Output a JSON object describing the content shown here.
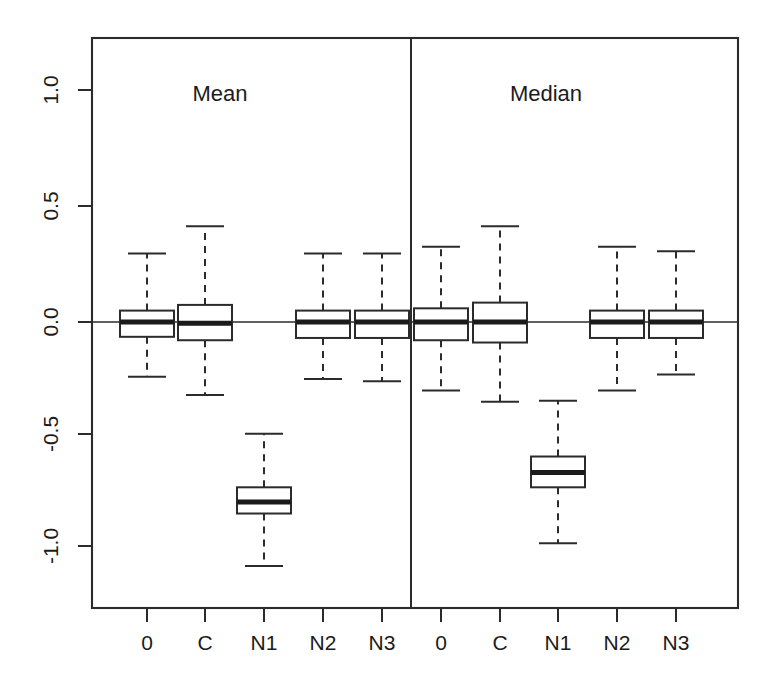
{
  "figure": {
    "title": "",
    "background_color": "#ffffff",
    "foreground_color": "#2b2b2b",
    "width": 769,
    "height": 695
  },
  "panels": [
    {
      "id": "mean",
      "label": "Mean",
      "label_x": 220,
      "label_y": 101
    },
    {
      "id": "median",
      "label": "Median",
      "label_x": 546,
      "label_y": 101
    }
  ],
  "axes": {
    "y": {
      "label": "",
      "ticks": [
        {
          "value": 1.0,
          "label": "1.0",
          "y": 90
        },
        {
          "value": 0.5,
          "label": "0.5",
          "y": 206
        },
        {
          "value": 0.0,
          "label": "0.0",
          "y": 322
        },
        {
          "value": -0.5,
          "label": "-0.5",
          "y": 434
        },
        {
          "value": -1.0,
          "label": "-1.0",
          "y": 546
        }
      ],
      "range": [
        -1.28,
        1.28
      ],
      "rotated_labels": true
    },
    "x": {
      "label": "",
      "ticks": [
        {
          "label": "0",
          "x": 147
        },
        {
          "label": "C",
          "x": 205
        },
        {
          "label": "N1",
          "x": 264
        },
        {
          "label": "N2",
          "x": 323
        },
        {
          "label": "N3",
          "x": 382
        },
        {
          "label": "0",
          "x": 441
        },
        {
          "label": "C",
          "x": 500
        },
        {
          "label": "N1",
          "x": 558
        },
        {
          "label": "N2",
          "x": 617
        },
        {
          "label": "N3",
          "x": 676
        }
      ]
    }
  },
  "geometry": {
    "plot_left": 92,
    "plot_right": 738,
    "plot_top": 38,
    "plot_bottom": 608,
    "divider_x": 411,
    "zero_y": 322,
    "px_per_unit": 228,
    "box_half_width": 27,
    "cap_half_width": 19
  },
  "chart_data": {
    "type": "boxplot",
    "title": "",
    "xlabel": "",
    "ylabel": "",
    "ylim": [
      -1.28,
      1.28
    ],
    "grid": false,
    "legend": "none",
    "reference_line": 0.0,
    "panels": [
      "Mean",
      "Median"
    ],
    "categories": [
      "0",
      "C",
      "N1",
      "N2",
      "N3"
    ],
    "boxes": [
      {
        "panel": "Mean",
        "category": "0",
        "whisker_low": -0.24,
        "q1": -0.065,
        "median": 0.0,
        "q3": 0.05,
        "whisker_high": 0.3
      },
      {
        "panel": "Mean",
        "category": "C",
        "whisker_low": -0.32,
        "q1": -0.08,
        "median": -0.005,
        "q3": 0.075,
        "whisker_high": 0.42
      },
      {
        "panel": "Mean",
        "category": "N1",
        "whisker_low": -1.07,
        "q1": -0.84,
        "median": -0.79,
        "q3": -0.725,
        "whisker_high": -0.49
      },
      {
        "panel": "Mean",
        "category": "N2",
        "whisker_low": -0.25,
        "q1": -0.07,
        "median": 0.0,
        "q3": 0.05,
        "whisker_high": 0.3
      },
      {
        "panel": "Mean",
        "category": "N3",
        "whisker_low": -0.26,
        "q1": -0.07,
        "median": 0.0,
        "q3": 0.05,
        "whisker_high": 0.3
      },
      {
        "panel": "Median",
        "category": "0",
        "whisker_low": -0.3,
        "q1": -0.08,
        "median": 0.0,
        "q3": 0.06,
        "whisker_high": 0.33
      },
      {
        "panel": "Median",
        "category": "C",
        "whisker_low": -0.35,
        "q1": -0.09,
        "median": 0.0,
        "q3": 0.085,
        "whisker_high": 0.42
      },
      {
        "panel": "Median",
        "category": "N1",
        "whisker_low": -0.97,
        "q1": -0.725,
        "median": -0.66,
        "q3": -0.59,
        "whisker_high": -0.345
      },
      {
        "panel": "Median",
        "category": "N2",
        "whisker_low": -0.3,
        "q1": -0.07,
        "median": 0.0,
        "q3": 0.05,
        "whisker_high": 0.33
      },
      {
        "panel": "Median",
        "category": "N3",
        "whisker_low": -0.23,
        "q1": -0.07,
        "median": 0.0,
        "q3": 0.05,
        "whisker_high": 0.31
      }
    ]
  }
}
